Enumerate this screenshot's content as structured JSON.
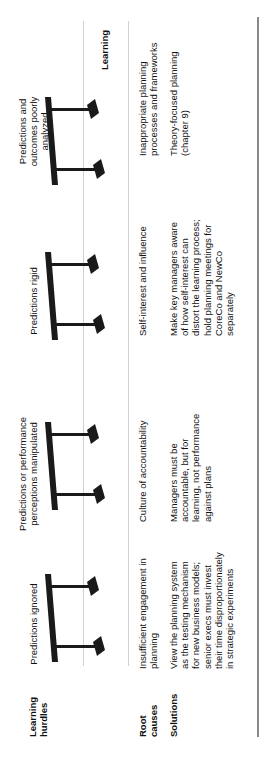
{
  "row_labels": {
    "hurdles": "Learning hurdles",
    "root_causes": "Root causes",
    "solutions": "Solutions"
  },
  "end_label": "Learning",
  "hurdles": [
    {
      "title": "Predictions ignored",
      "root_cause": "Insufficient engagement in planning",
      "solution": "View the planning system as the testing mechanism for new business models; senior execs must invest their time disproportionately in strategic experiments"
    },
    {
      "title": "Predictions or performance perceptions manipulated",
      "root_cause": "Culture of accountability",
      "solution": "Managers must be accountable, but for learning, not performance against plans"
    },
    {
      "title": "Predictions rigid",
      "root_cause": "Self-interest and influence",
      "solution": "Make key managers aware of how self-interest can distort the learning process; hold planning meetings for CoreCo and NewCo separately"
    },
    {
      "title": "Predictions and outcomes poorly analyzed",
      "root_cause": "Inappropriate planning processes and frameworks",
      "solution": "Theory-focused planning (chapter 9)"
    }
  ],
  "icons": {
    "hurdle": "hurdle-icon"
  },
  "colors": {
    "text": "#111111",
    "gridline": "#d0d0d0",
    "border": "#8a8a8a",
    "hurdle": "#1a1a1a"
  }
}
